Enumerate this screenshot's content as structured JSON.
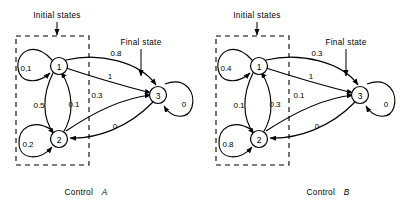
{
  "figure": {
    "type": "state-transition-diagram-pair",
    "background": "#ffffff",
    "stroke_color": "#000000"
  },
  "diagrams": [
    {
      "id": "control-a",
      "caption_prefix": "Control",
      "caption_name": "A",
      "initial_states_label": "Initial states",
      "final_state_label": "Final state",
      "nodes": [
        {
          "id": "1",
          "label": "1",
          "role": "initial"
        },
        {
          "id": "2",
          "label": "2",
          "role": "initial"
        },
        {
          "id": "3",
          "label": "3",
          "role": "final"
        }
      ],
      "transitions": [
        {
          "from": "1",
          "to": "1",
          "label": "0,1",
          "kind": "self-loop"
        },
        {
          "from": "1",
          "to": "2",
          "label": "0.5",
          "kind": "curve"
        },
        {
          "from": "2",
          "to": "1",
          "label": "0.1",
          "kind": "curve"
        },
        {
          "from": "1",
          "to": "3",
          "label": "0.8",
          "kind": "curve"
        },
        {
          "from": "1",
          "to": "3",
          "label": "1",
          "kind": "curve"
        },
        {
          "from": "2",
          "to": "3",
          "label": "0.3",
          "kind": "curve"
        },
        {
          "from": "3",
          "to": "2",
          "label": "0",
          "kind": "curve"
        },
        {
          "from": "2",
          "to": "2",
          "label": "0.2",
          "kind": "self-loop"
        },
        {
          "from": "3",
          "to": "3",
          "label": "0",
          "kind": "self-loop"
        }
      ]
    },
    {
      "id": "control-b",
      "caption_prefix": "Control",
      "caption_name": "B",
      "initial_states_label": "Initial states",
      "final_state_label": "Final state",
      "nodes": [
        {
          "id": "1",
          "label": "1",
          "role": "initial"
        },
        {
          "id": "2",
          "label": "2",
          "role": "initial"
        },
        {
          "id": "3",
          "label": "3",
          "role": "final"
        }
      ],
      "transitions": [
        {
          "from": "1",
          "to": "1",
          "label": "0.4",
          "kind": "self-loop"
        },
        {
          "from": "1",
          "to": "2",
          "label": "0.1",
          "kind": "curve"
        },
        {
          "from": "2",
          "to": "1",
          "label": "0.3",
          "kind": "curve"
        },
        {
          "from": "1",
          "to": "3",
          "label": "0.3",
          "kind": "curve"
        },
        {
          "from": "1",
          "to": "3",
          "label": "1",
          "kind": "curve"
        },
        {
          "from": "2",
          "to": "3",
          "label": "0.1",
          "kind": "curve"
        },
        {
          "from": "3",
          "to": "2",
          "label": "0",
          "kind": "curve"
        },
        {
          "from": "2",
          "to": "2",
          "label": "0.8",
          "kind": "self-loop"
        },
        {
          "from": "3",
          "to": "3",
          "label": "0",
          "kind": "self-loop"
        }
      ]
    }
  ]
}
